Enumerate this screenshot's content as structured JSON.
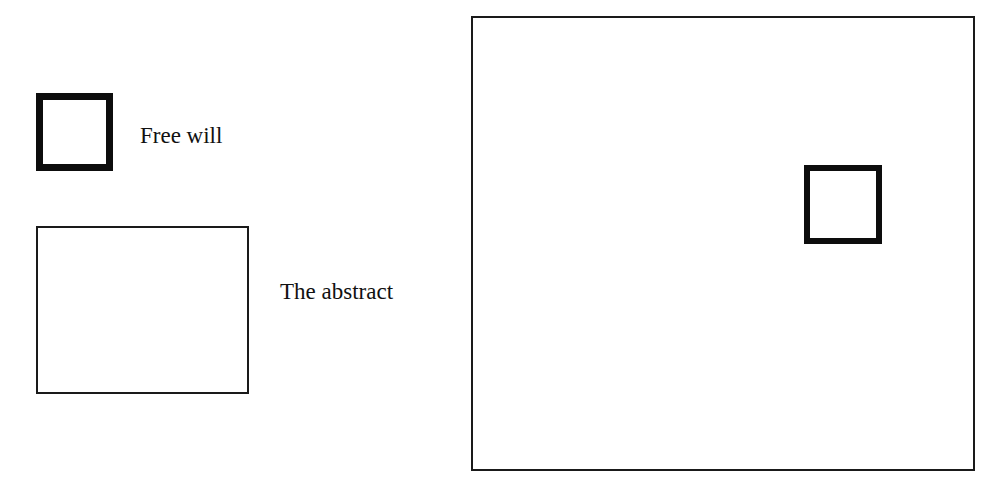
{
  "diagram": {
    "title": "",
    "background_color": "#ffffff",
    "stroke_color": "#0d0d0d",
    "text_color": "#111111",
    "labels": {
      "free_will": "Free will",
      "the_abstract": "The abstract"
    },
    "shapes": [
      {
        "name": "free-will-square",
        "type": "square",
        "stroke": "thick",
        "stroke_width_px": 7,
        "fill": "none",
        "x": 36,
        "y": 93,
        "width": 77,
        "height": 78,
        "label": "Free will"
      },
      {
        "name": "abstract-rectangle",
        "type": "rectangle",
        "stroke": "thin",
        "stroke_width_px": 2,
        "fill": "none",
        "x": 36,
        "y": 226,
        "width": 213,
        "height": 168,
        "label": "The abstract"
      },
      {
        "name": "outer-rectangle",
        "type": "rectangle",
        "stroke": "thin",
        "stroke_width_px": 2,
        "fill": "none",
        "x": 471,
        "y": 16,
        "width": 504,
        "height": 455,
        "label": ""
      },
      {
        "name": "embedded-square",
        "type": "square",
        "stroke": "thick",
        "stroke_width_px": 6,
        "fill": "none",
        "x": 802,
        "y": 163,
        "width": 78,
        "height": 79,
        "label": "",
        "contained_in": "outer-rectangle"
      }
    ]
  }
}
